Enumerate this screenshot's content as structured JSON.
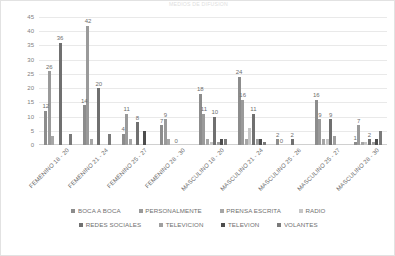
{
  "chart_data": {
    "type": "bar",
    "title": "MEDIOS DE DIFUSION",
    "xlabel": "",
    "ylabel": "",
    "ylim": [
      0,
      45
    ],
    "yticks": [
      45,
      40,
      35,
      30,
      25,
      20,
      15,
      10,
      5,
      0
    ],
    "grid": true,
    "legend_position": "bottom",
    "categories": [
      "FEMENINO 18 - 20",
      "FEMENINO 21 - 24",
      "FEMENINO 25 - 27",
      "FEMENINO 28 - 30",
      "MASCULINO 18 - 20",
      "MASCULINO 21 - 24",
      "MASCULINO 25 - 26",
      "MASCULINO 25 - 27",
      "MASCULINO 28 - 30"
    ],
    "series": [
      {
        "name": "BOCA A BOCA",
        "color": "#8c8c8c",
        "values": [
          12,
          14,
          4,
          7,
          18,
          24,
          2,
          16,
          1
        ],
        "labels": [
          "12",
          "14",
          "4",
          "7",
          "18",
          "24",
          "2",
          "16",
          "1"
        ]
      },
      {
        "name": "PERSONALMENTE",
        "color": "#9a9a9a",
        "values": [
          26,
          42,
          11,
          9,
          11,
          16,
          0,
          9,
          7
        ],
        "labels": [
          "26",
          "42",
          "11",
          "9",
          "11",
          "16",
          "0",
          "9",
          "7"
        ]
      },
      {
        "name": "PRENSA ESCRITA",
        "color": "#a6a6a6",
        "values": [
          3,
          2,
          2,
          2,
          2,
          2,
          0,
          2,
          1
        ],
        "labels": [
          "",
          "",
          "",
          "",
          "",
          "",
          "",
          "",
          ""
        ]
      },
      {
        "name": "RADIO",
        "color": "#c6c6c6",
        "values": [
          0,
          0,
          0,
          0,
          1,
          6,
          0,
          2,
          1
        ],
        "labels": [
          "",
          "",
          "",
          "",
          "",
          "",
          "",
          "",
          ""
        ]
      },
      {
        "name": "REDES SOCIALES",
        "color": "#707070",
        "values": [
          36,
          20,
          8,
          0,
          10,
          11,
          2,
          9,
          2
        ],
        "labels": [
          "36",
          "20",
          "8",
          "0",
          "10",
          "11",
          "2",
          "9",
          "2"
        ]
      },
      {
        "name": "TELEVICION",
        "color": "#9f9f9f",
        "values": [
          0,
          0,
          0,
          0,
          1,
          2,
          0,
          3,
          1
        ],
        "labels": [
          "",
          "",
          "",
          "",
          "",
          "",
          "",
          "",
          ""
        ]
      },
      {
        "name": "TELEVION",
        "color": "#4d4d4d",
        "values": [
          0,
          0,
          5,
          0,
          2,
          2,
          0,
          0,
          2
        ],
        "labels": [
          "",
          "",
          "",
          "",
          "",
          "",
          "",
          "",
          ""
        ]
      },
      {
        "name": "VOLANTES",
        "color": "#7a7a7a",
        "values": [
          4,
          4,
          0,
          0,
          2,
          1,
          0,
          0,
          5
        ],
        "labels": [
          "",
          "",
          "",
          "",
          "",
          "",
          "",
          "",
          ""
        ]
      }
    ],
    "extra_labels": [
      {
        "group": 2,
        "text": "8"
      },
      {
        "group": 3,
        "text": "0"
      }
    ]
  }
}
